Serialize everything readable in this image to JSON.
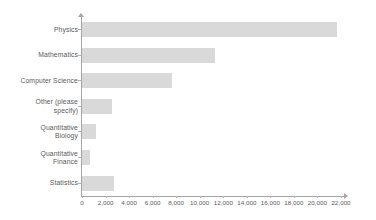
{
  "chart_data": {
    "type": "bar",
    "orientation": "horizontal",
    "title": "",
    "subtitle": "",
    "xlabel": "",
    "ylabel": "",
    "xlim": [
      0,
      22000
    ],
    "grid": false,
    "legend": false,
    "legend_position": "none",
    "bar_color": "#d9d9d9",
    "axis_color": "#a6a6a6",
    "text_color": "#5a5a5c",
    "categories": [
      "Physics",
      "Mathematics",
      "Computer Science",
      "Other (please specify)",
      "Quantitative Biology",
      "Quantitative Finance",
      "Statistics"
    ],
    "category_labels_wrapped": [
      "Physics",
      "Mathematics",
      "Computer Science",
      "Other (please\nspecify)",
      "Quantitative\nBiology",
      "Quantitative\nFinance",
      "Statistics"
    ],
    "values": [
      21650,
      11300,
      7650,
      2550,
      1200,
      700,
      2700
    ],
    "xticks": [
      0,
      2000,
      4000,
      6000,
      8000,
      10000,
      12000,
      14000,
      16000,
      18000,
      20000,
      22000
    ],
    "xticklabels": [
      "0",
      "2,000",
      "4,000",
      "6,000",
      "8,000",
      "10,000",
      "12,000",
      "14,000",
      "16,000",
      "18,000",
      "20,000",
      "22,000"
    ]
  }
}
